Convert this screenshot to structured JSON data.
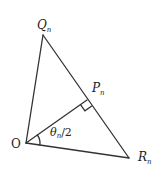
{
  "figure": {
    "type": "geometry",
    "stroke_color": "#333333",
    "background": "#ffffff"
  },
  "points": {
    "O": {
      "label": "O",
      "x": 26,
      "y": 143
    },
    "Q": {
      "label": "Q",
      "subscript": "n",
      "x": 43,
      "y": 35
    },
    "R": {
      "label": "R",
      "subscript": "n",
      "x": 129,
      "y": 158
    },
    "P": {
      "label": "P",
      "subscript": "n",
      "x": 87,
      "y": 100
    }
  },
  "segments": [
    {
      "from": "O",
      "to": "Q"
    },
    {
      "from": "Q",
      "to": "R"
    },
    {
      "from": "O",
      "to": "R"
    },
    {
      "from": "O",
      "to": "P"
    }
  ],
  "annotations": {
    "right_angle_at": "P",
    "angle": {
      "vertex": "O",
      "between": [
        "P",
        "R"
      ],
      "label_theta": "θ",
      "label_sub": "n",
      "label_rest": "/2"
    }
  }
}
